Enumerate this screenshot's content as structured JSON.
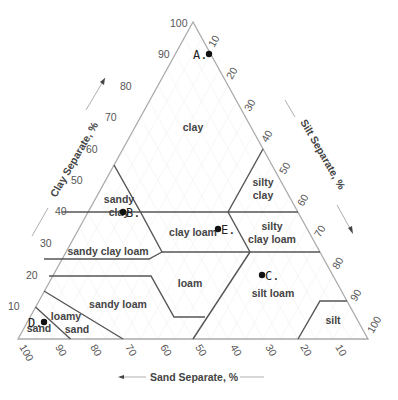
{
  "diagram": {
    "type": "soil-texture-triangle",
    "axes": {
      "clay": {
        "title": "Clay Separate, %",
        "ticks": [
          "10",
          "20",
          "30",
          "40",
          "50",
          "60",
          "70",
          "80",
          "90",
          "100"
        ]
      },
      "silt": {
        "title": "Silt Separate, %",
        "ticks": [
          "10",
          "20",
          "30",
          "40",
          "50",
          "60",
          "70",
          "80",
          "90",
          "100"
        ]
      },
      "sand": {
        "title": "Sand Separate, %",
        "ticks": [
          "100",
          "90",
          "80",
          "70",
          "60",
          "50",
          "40",
          "30",
          "20",
          "10"
        ]
      }
    },
    "regions": {
      "clay": "clay",
      "sandy_clay_1": "sandy",
      "sandy_clay_2": "clay",
      "silty_clay_1": "silty",
      "silty_clay_2": "clay",
      "clay_loam": "clay loam",
      "silty_clay_loam_1": "silty",
      "silty_clay_loam_2": "clay loam",
      "sandy_clay_loam": "sandy clay loam",
      "loam": "loam",
      "silt_loam": "silt loam",
      "sandy_loam": "sandy loam",
      "loamy_sand_1": "loamy",
      "loamy_sand_2": "sand",
      "sand": "sand",
      "silt": "silt"
    },
    "points": [
      {
        "label": "A.",
        "description": "near 90% clay"
      },
      {
        "label": "B.",
        "description": "sandy clay / sandy clay loam boundary"
      },
      {
        "label": "C.",
        "description": "silt loam"
      },
      {
        "label": "D.",
        "description": "sand"
      },
      {
        "label": "E.",
        "description": "clay loam"
      }
    ],
    "colors": {
      "outline": "#aaaaaa",
      "boundary": "#555555",
      "point": "#111111"
    }
  }
}
